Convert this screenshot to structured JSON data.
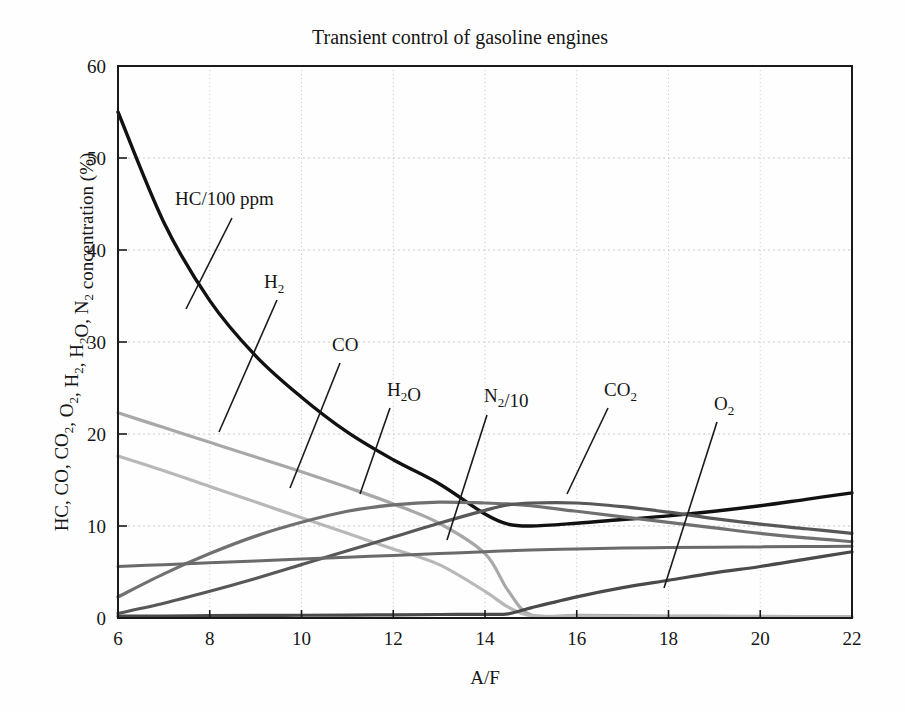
{
  "figure": {
    "title": "Transient control of gasoline engines",
    "background_color": "#fefefe",
    "frame_color": "#1a1a1a"
  },
  "chart_data": {
    "type": "line",
    "title": "Transient control of gasoline engines",
    "xlabel": "A/F",
    "ylabel": "HC, CO, CO2, O2, H2, H2O, N2 concentration (%)",
    "ylabel_display": "HC, CO, CO₂, O₂, H₂, H₂O, N₂ concentration (%)",
    "xlim": [
      6,
      22
    ],
    "ylim": [
      0,
      60
    ],
    "xticks": [
      6,
      8,
      10,
      12,
      14,
      16,
      18,
      20,
      22
    ],
    "yticks": [
      0,
      10,
      20,
      30,
      40,
      50,
      60
    ],
    "grid": "dotted both axes at major ticks",
    "legend_position": "inline curve labels with leader lines",
    "x": [
      6,
      7,
      8,
      9,
      10,
      11,
      12,
      13,
      14,
      14.5,
      15,
      16,
      17,
      18,
      19,
      20,
      21,
      22
    ],
    "series": [
      {
        "name": "HC/100 ppm",
        "label": "HC/100 ppm",
        "color": "#111111",
        "width": 3.4,
        "values": [
          55.0,
          43.0,
          34.5,
          28.5,
          24.0,
          20.2,
          17.2,
          14.6,
          11.3,
          10.2,
          10.0,
          10.3,
          10.7,
          11.1,
          11.6,
          12.2,
          12.9,
          13.6
        ]
      },
      {
        "name": "CO",
        "label": "CO",
        "color": "#a8a8a8",
        "width": 3.2,
        "values": [
          22.3,
          20.7,
          19.1,
          17.5,
          15.9,
          14.2,
          12.4,
          10.3,
          7.0,
          3.0,
          0.35,
          0.3,
          0.26,
          0.22,
          0.2,
          0.18,
          0.16,
          0.15
        ]
      },
      {
        "name": "H2",
        "label": "H₂",
        "color": "#b8b8b8",
        "width": 3.2,
        "values": [
          17.6,
          16.0,
          14.3,
          12.6,
          10.9,
          9.2,
          7.5,
          5.8,
          2.9,
          1.2,
          0.25,
          0.2,
          0.18,
          0.16,
          0.15,
          0.14,
          0.13,
          0.12
        ]
      },
      {
        "name": "CO2",
        "label": "CO₂",
        "color": "#707070",
        "width": 3.2,
        "values": [
          2.3,
          4.8,
          7.0,
          8.9,
          10.4,
          11.6,
          12.3,
          12.6,
          12.5,
          12.4,
          12.2,
          11.6,
          11.0,
          10.4,
          9.8,
          9.2,
          8.7,
          8.3
        ]
      },
      {
        "name": "H2O",
        "label": "H₂O",
        "color": "#585858",
        "width": 3.2,
        "values": [
          0.5,
          1.6,
          2.9,
          4.3,
          5.8,
          7.3,
          8.8,
          10.3,
          11.7,
          12.3,
          12.5,
          12.5,
          12.1,
          11.5,
          10.8,
          10.2,
          9.7,
          9.2
        ]
      },
      {
        "name": "N2/10",
        "label": "N₂/10",
        "color": "#6a6a6a",
        "width": 3.0,
        "values": [
          5.6,
          5.8,
          6.0,
          6.2,
          6.4,
          6.6,
          6.8,
          7.0,
          7.2,
          7.3,
          7.4,
          7.5,
          7.6,
          7.65,
          7.7,
          7.73,
          7.76,
          7.8
        ]
      },
      {
        "name": "O2",
        "label": "O₂",
        "color": "#4a4a4a",
        "width": 3.2,
        "values": [
          0.2,
          0.22,
          0.25,
          0.28,
          0.3,
          0.32,
          0.35,
          0.38,
          0.4,
          0.45,
          1.1,
          2.3,
          3.3,
          4.1,
          4.9,
          5.6,
          6.4,
          7.2
        ]
      }
    ],
    "annotations": [
      {
        "text": "HC/100 ppm",
        "lx": 175,
        "ly": 205,
        "leader": [
          [
            232,
            218
          ],
          [
            186,
            309
          ]
        ]
      },
      {
        "text": "H₂",
        "lx": 264,
        "ly": 288,
        "leader": [
          [
            277,
            300
          ],
          [
            219,
            432
          ]
        ]
      },
      {
        "text": "CO",
        "lx": 332,
        "ly": 351,
        "leader": [
          [
            340,
            363
          ],
          [
            290,
            488
          ]
        ]
      },
      {
        "text": "H₂O",
        "lx": 387,
        "ly": 396,
        "leader": [
          [
            390,
            408
          ],
          [
            360,
            494
          ]
        ]
      },
      {
        "text": "N₂/10",
        "lx": 484,
        "ly": 402,
        "leader": [
          [
            487,
            415
          ],
          [
            447,
            540
          ]
        ]
      },
      {
        "text": "CO₂",
        "lx": 604,
        "ly": 396,
        "leader": [
          [
            608,
            408
          ],
          [
            567,
            494
          ]
        ]
      },
      {
        "text": "O₂",
        "lx": 714,
        "ly": 410,
        "leader": [
          [
            717,
            422
          ],
          [
            664,
            588
          ]
        ]
      }
    ]
  }
}
